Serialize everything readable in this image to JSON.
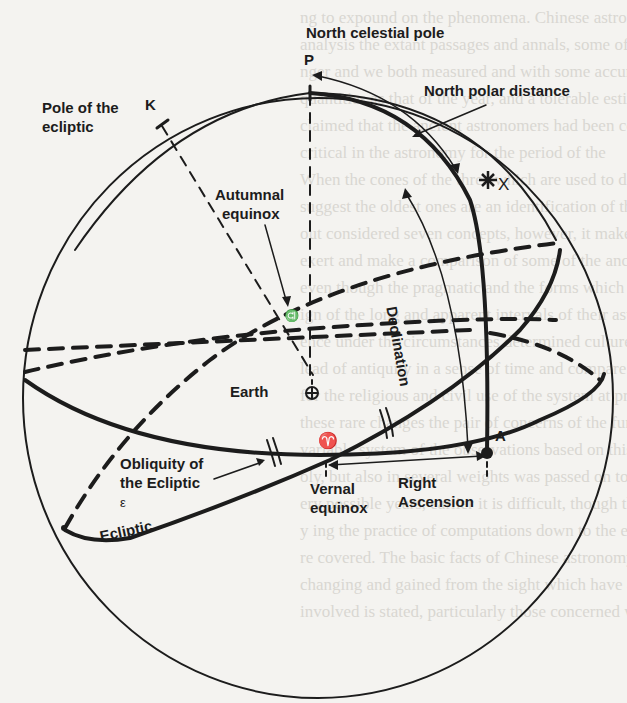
{
  "diagram": {
    "labels": {
      "north_celestial_pole": "North celestial pole",
      "p_marker": "P",
      "north_polar_distance": "North polar distance",
      "pole_of_ecliptic_line1": "Pole of the",
      "pole_of_ecliptic_line2": "ecliptic",
      "k_marker": "K",
      "autumnal_line1": "Autumnal",
      "autumnal_line2": "equinox",
      "x_marker": "X",
      "declination": "Declination",
      "earth": "Earth",
      "a_marker": "A",
      "obliquity_line1": "Obliquity of",
      "obliquity_line2": "the Ecliptic",
      "epsilon": "ε",
      "ecliptic": "Ecliptic",
      "vernal_line1": "Vernal",
      "vernal_line2": "equinox",
      "right_ascension_line1": "Right",
      "right_ascension_line2": "Ascension",
      "aries_symbol": "♈",
      "libra_symbol": "♎"
    },
    "colors": {
      "ink": "#1c1c1c",
      "paper": "#f4f3f0",
      "bleed_text": "#d9d7d2"
    }
  },
  "background_text": [
    "ng to expound on the phenomena. Chinese astronomy",
    "analysis the extant passages and annals, some of which are",
    "nger and we both measured and with some accuracy",
    "quantities as that of the year, and a tolerable estimate of",
    "claimed that the ancient astronomers had been correct; the arti",
    "critical in the astronomy for the period of the",
    "When the cones of the three which are used to define",
    "suggest the oldest ones are an identification of the constellations",
    "out considered seven concepts, however, it makes the legacy",
    "exert and make a comparison of some of the ancient terms",
    "even though the pragmatic and the forms which are presented",
    "ign of the long and apparent intervals of their astronomical",
    "ence under the circumstances determined cultures first, but",
    "lead of antiquity in a sense of time and compare the effect",
    "for the religious and civil use of the system at present",
    "these rare changes the pair of concerns of the fundamental",
    "variable system of the observations based on this fact",
    "oly, but also in several weights was passed on to be",
    "ery possible years, earlier it is difficult, though these times",
    "y ing the practice of computations down to the eleventh century",
    "re covered. The basic facts of Chinese astronomy are based",
    "changing and gained from the sight which have all things",
    "involved is stated, particularly those concerned with the"
  ]
}
